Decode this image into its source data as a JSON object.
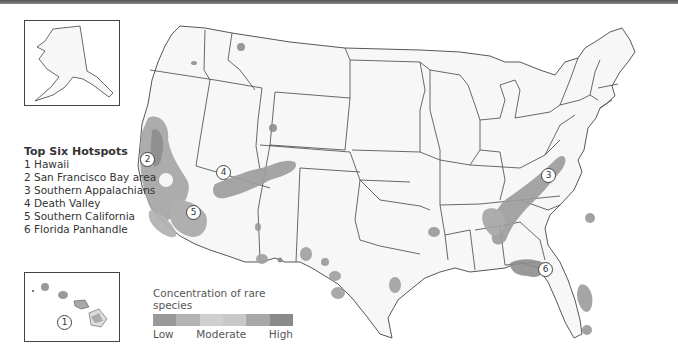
{
  "hotspots": {
    "title": "Top Six Hotspots",
    "items": [
      "1 Hawaii",
      "2 San Francisco Bay area",
      "3 Southern Appalachians",
      "4 Death Valley",
      "5 Southern California",
      "6 Florida Panhandle"
    ]
  },
  "markers": [
    "1",
    "2",
    "3",
    "4",
    "5",
    "6"
  ],
  "legend": {
    "title": "Concentration of rare species",
    "low": "Low",
    "moderate": "Moderate",
    "high": "High",
    "colors": [
      "#9a9a9a",
      "#b4b4b4",
      "#cfcfcf",
      "#c8c8c8",
      "#a8a8a8",
      "#8a8a8a"
    ]
  },
  "insets": {
    "alaska": "Alaska",
    "hawaii": "Hawaii"
  },
  "colors": {
    "land": "#f7f7f7",
    "border": "#444444",
    "hotspot_low": "#a0a0a0",
    "hotspot_high": "#7a7a7a"
  }
}
